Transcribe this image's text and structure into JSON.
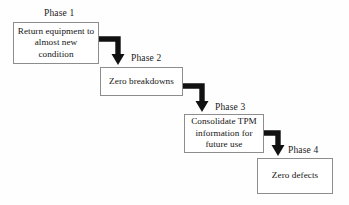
{
  "diagram": {
    "type": "step-cascade-flowchart",
    "background_color": "#fefefe",
    "box_border_color": "#8d8d8d",
    "arrow_color": "#111111",
    "text_color": "#141414",
    "phases": [
      {
        "label": "Phase 1",
        "text": "Return equipment to almost new condition"
      },
      {
        "label": "Phase 2",
        "text": "Zero breakdowns"
      },
      {
        "label": "Phase 3",
        "text": "Consolidate TPM information for future use"
      },
      {
        "label": "Phase 4",
        "text": "Zero defects"
      }
    ],
    "connectors": [
      {
        "name": "arrow-phase-1-to-phase-2",
        "from": "Phase 1",
        "to": "Phase 2",
        "shape": "elbow-right-down"
      },
      {
        "name": "arrow-phase-2-to-phase-3",
        "from": "Phase 2",
        "to": "Phase 3",
        "shape": "elbow-right-down"
      },
      {
        "name": "arrow-phase-3-to-phase-4",
        "from": "Phase 3",
        "to": "Phase 4",
        "shape": "elbow-right-down"
      }
    ]
  }
}
